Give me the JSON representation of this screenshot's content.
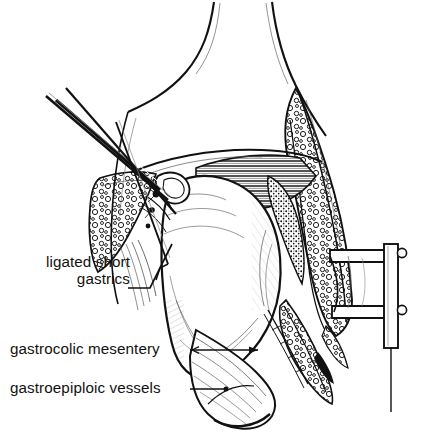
{
  "figure": {
    "type": "medical-line-illustration",
    "background_color": "#ffffff",
    "ink_color": "#111111",
    "width": 433,
    "height": 446
  },
  "labels": [
    {
      "id": "ligated-short-gastrics",
      "line1": "ligated short",
      "line2": "gastrics",
      "text": "ligated short gastrics",
      "x": 10,
      "y": 260,
      "leader": {
        "style": "bent-line",
        "from_x": 128,
        "from_y": 288,
        "to_x": 166,
        "to_y": 246
      }
    },
    {
      "id": "gastrocolic-mesentery",
      "line1": "gastrocolic mesentery",
      "line2": "",
      "text": "gastrocolic mesentery",
      "x": 10,
      "y": 340,
      "leader": {
        "style": "arrow",
        "from_x": 190,
        "from_y": 350,
        "to_x": 262,
        "to_y": 350
      }
    },
    {
      "id": "gastroepiploic-vessels",
      "line1": "gastroepiploic  vessels",
      "line2": "",
      "text": "gastroepiploic vessels",
      "x": 10,
      "y": 379,
      "leader": {
        "style": "dot-line",
        "from_x": 190,
        "from_y": 389,
        "to_x": 226,
        "to_y": 389
      }
    }
  ],
  "structures": [
    {
      "name": "abdominal-wall-incision-left",
      "kind": "outline"
    },
    {
      "name": "abdominal-wall-incision-right",
      "kind": "outline"
    },
    {
      "name": "subcutaneous-fat-right",
      "kind": "stipple-texture"
    },
    {
      "name": "subcutaneous-fat-left",
      "kind": "stipple-texture"
    },
    {
      "name": "abdominal-muscle-hatched",
      "kind": "parallel-hatch"
    },
    {
      "name": "peritoneum-dark-band",
      "kind": "dense-stipple"
    },
    {
      "name": "stomach-body",
      "kind": "shaded-organ"
    },
    {
      "name": "greater-omentum",
      "kind": "shaded-organ"
    },
    {
      "name": "surgical-clamp",
      "kind": "instrument"
    },
    {
      "name": "forceps-shaft-upper",
      "kind": "instrument"
    },
    {
      "name": "forceps-shaft-lower",
      "kind": "instrument"
    },
    {
      "name": "retractor-blade",
      "kind": "instrument"
    },
    {
      "name": "retractor-post",
      "kind": "instrument"
    }
  ]
}
